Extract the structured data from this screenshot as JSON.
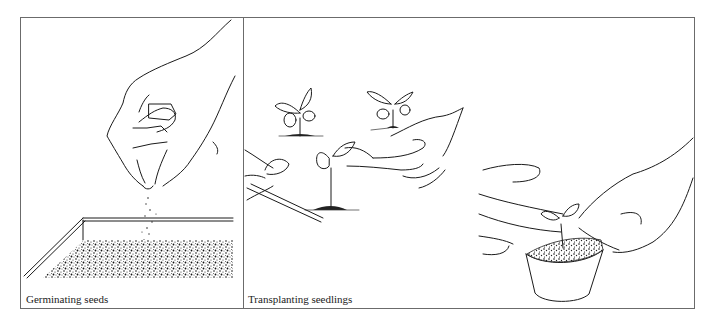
{
  "figure": {
    "panels": [
      {
        "id": "germinating",
        "caption": "Germinating seeds",
        "illustration": "hand sprinkling seeds into a soil-filled seed tray"
      },
      {
        "id": "transplanting",
        "caption": "Transplanting seedlings",
        "illustration": "hands using a dibber to lift a seedling, then firming a seedling into a small pot"
      }
    ],
    "colors": {
      "border": "#6b6b6b",
      "ink": "#1a1a1a",
      "background": "#ffffff"
    }
  }
}
